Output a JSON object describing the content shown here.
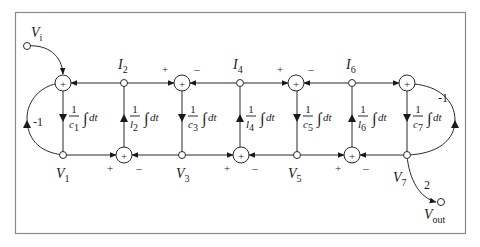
{
  "diagram": {
    "type": "signal-flow block diagram (leapfrog ladder filter)",
    "frame_color": "#8a8a8a",
    "line_color": "#2a2a2a",
    "input": {
      "label": "V",
      "sub": "i"
    },
    "output": {
      "label": "V",
      "sub": "out",
      "gain": "2"
    },
    "summer_symbol": "+",
    "plus_sign": "+",
    "minus_sign": "–",
    "feedback_left": "-1",
    "feedback_right": "-1",
    "top_nodes": [
      {
        "label": "I",
        "sub": "2"
      },
      {
        "label": "I",
        "sub": "4"
      },
      {
        "label": "I",
        "sub": "6"
      }
    ],
    "bottom_nodes": [
      {
        "label": "V",
        "sub": "1"
      },
      {
        "label": "V",
        "sub": "3"
      },
      {
        "label": "V",
        "sub": "5"
      },
      {
        "label": "V",
        "sub": "7"
      }
    ],
    "integrators": [
      {
        "num": "1",
        "den": "c",
        "sub": "1",
        "tail": "dt",
        "direction": "down"
      },
      {
        "num": "1",
        "den": "l",
        "sub": "2",
        "tail": "dt",
        "direction": "up"
      },
      {
        "num": "1",
        "den": "c",
        "sub": "3",
        "tail": "dt",
        "direction": "down"
      },
      {
        "num": "1",
        "den": "l",
        "sub": "4",
        "tail": "dt",
        "direction": "up"
      },
      {
        "num": "1",
        "den": "c",
        "sub": "5",
        "tail": "dt",
        "direction": "down"
      },
      {
        "num": "1",
        "den": "l",
        "sub": "6",
        "tail": "dt",
        "direction": "up"
      },
      {
        "num": "1",
        "den": "c",
        "sub": "7",
        "tail": "dt",
        "direction": "down"
      }
    ],
    "integral_symbol": "∫"
  }
}
